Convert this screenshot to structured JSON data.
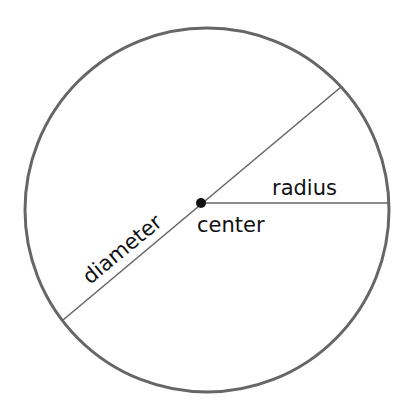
{
  "diagram": {
    "labels": {
      "diameter": "diameter",
      "radius": "radius",
      "center": "center"
    },
    "colors": {
      "circle": "#666666",
      "lines": "#666666",
      "dot": "#111111",
      "text": "#111111"
    }
  }
}
